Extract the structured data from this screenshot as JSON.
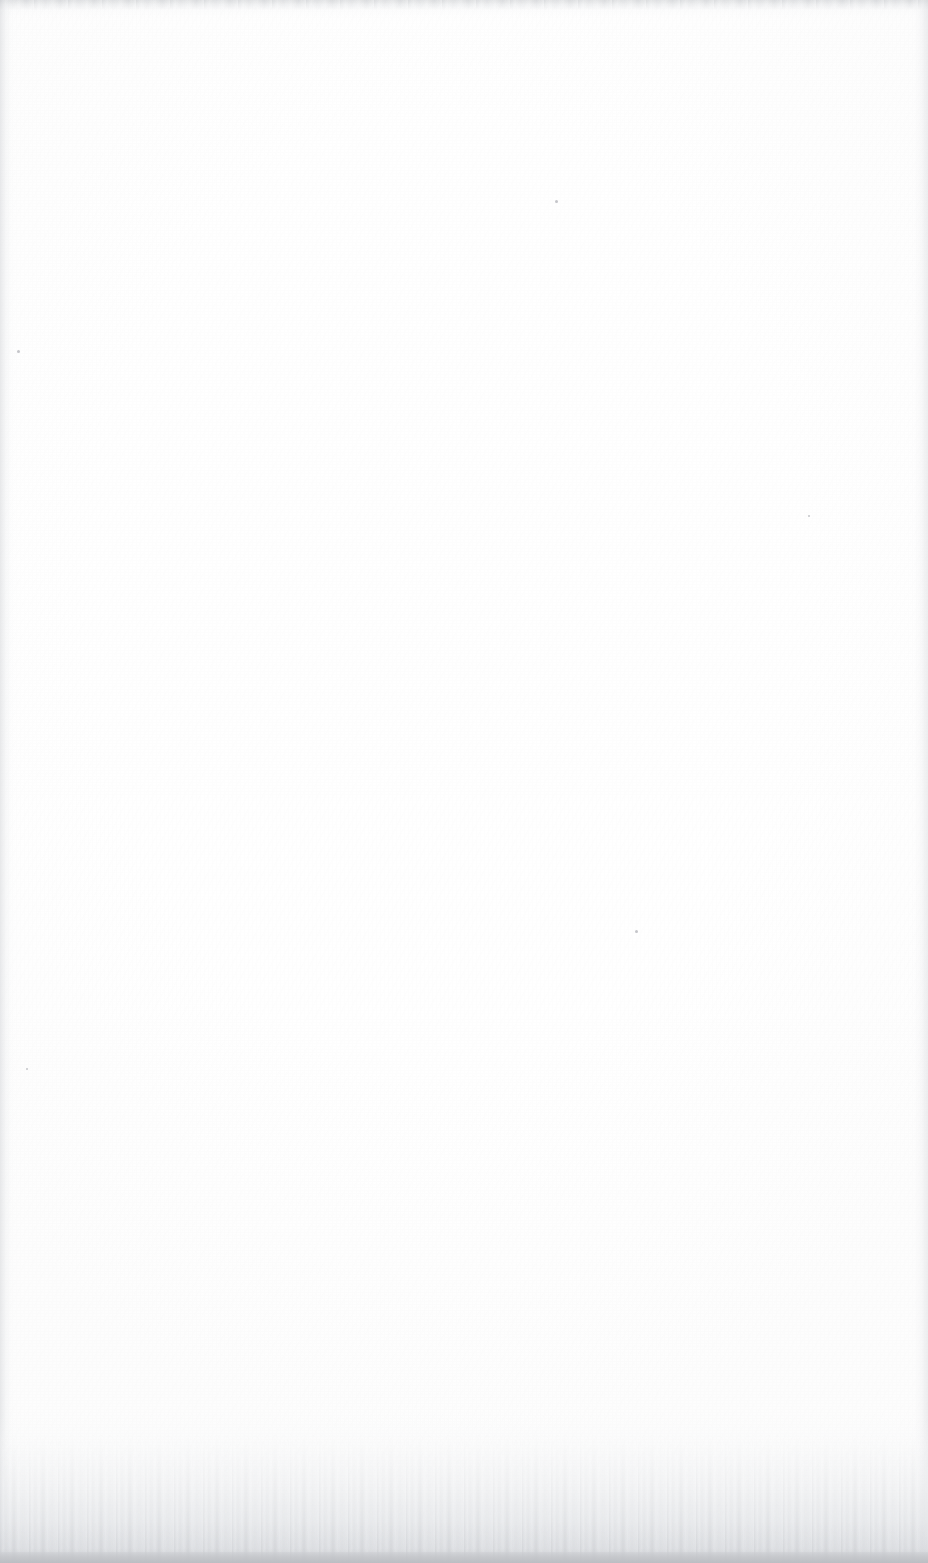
{
  "document": {
    "kind": "scanned-page",
    "page_state": "blank",
    "page_note": "This page intentionally left blank",
    "width_px": 928,
    "height_px": 1563,
    "text_content": "",
    "visible_text_elements": []
  },
  "paper": {
    "base_color": "#fefefe",
    "tone_light": "#ffffff",
    "tone_shade": "#fafafa",
    "grain_description": "fine scanner noise"
  },
  "artifacts": {
    "top_edge": {
      "label": "top scanner edge band",
      "color": "#cdcfd2",
      "height_px": 17
    },
    "left_edge": {
      "label": "left page edge shadow",
      "color": "#ced0d4",
      "width_px": 16
    },
    "right_edge": {
      "label": "right page edge shadow",
      "color": "#d2d4d8",
      "width_px": 18
    },
    "bottom_shadow": {
      "label": "bottom scanner shadow gradient",
      "color": "#cbcdd1",
      "line_color": "#bcbec3",
      "height_px": 150
    },
    "specks": [
      {
        "label": "dust-speck",
        "x": 17,
        "y": 350,
        "size": 3
      },
      {
        "label": "dust-speck",
        "x": 555,
        "y": 200,
        "size": 3
      },
      {
        "label": "dust-speck",
        "x": 635,
        "y": 930,
        "size": 3
      },
      {
        "label": "dust-speck",
        "x": 26,
        "y": 1068,
        "size": 2
      },
      {
        "label": "dust-speck",
        "x": 808,
        "y": 515,
        "size": 2
      }
    ]
  }
}
